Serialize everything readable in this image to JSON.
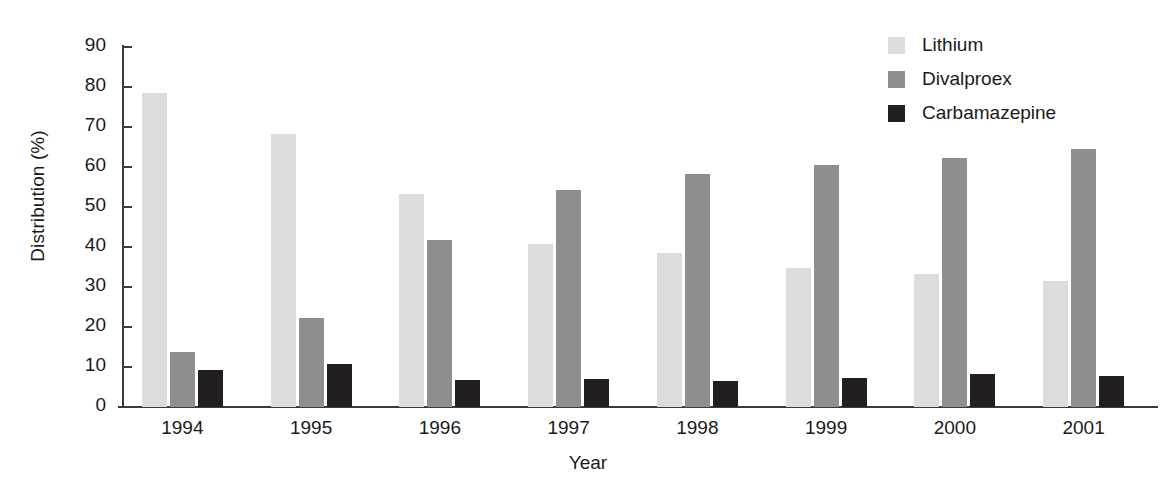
{
  "chart_data": {
    "type": "bar",
    "title": "",
    "xlabel": "Year",
    "ylabel": "Distribution (%)",
    "categories": [
      "1994",
      "1995",
      "1996",
      "1997",
      "1998",
      "1999",
      "2000",
      "2001"
    ],
    "ylim": [
      0,
      90
    ],
    "yticks": [
      0,
      10,
      20,
      30,
      40,
      50,
      60,
      70,
      80,
      90
    ],
    "ytick_labels": [
      "0",
      "10",
      "20",
      "30",
      "40",
      "50",
      "60",
      "70",
      "80",
      "90"
    ],
    "grid": false,
    "legend_position": "top-right",
    "series": [
      {
        "name": "Lithium",
        "color": "#dcdcda",
        "values": [
          78.6,
          68.3,
          53.3,
          40.8,
          38.5,
          34.8,
          33.3,
          31.4
        ]
      },
      {
        "name": "Divalproex",
        "color": "#8e8e8c",
        "values": [
          13.8,
          22.3,
          41.7,
          54.3,
          58.2,
          60.6,
          62.2,
          64.4
        ]
      },
      {
        "name": "Carbamazepine",
        "color": "#231f20",
        "values": [
          9.2,
          10.7,
          6.8,
          7.0,
          6.4,
          7.2,
          8.2,
          7.7
        ]
      }
    ]
  },
  "axis": {
    "line_color": "#3a3a3a",
    "text_color": "#1a1a1a"
  }
}
